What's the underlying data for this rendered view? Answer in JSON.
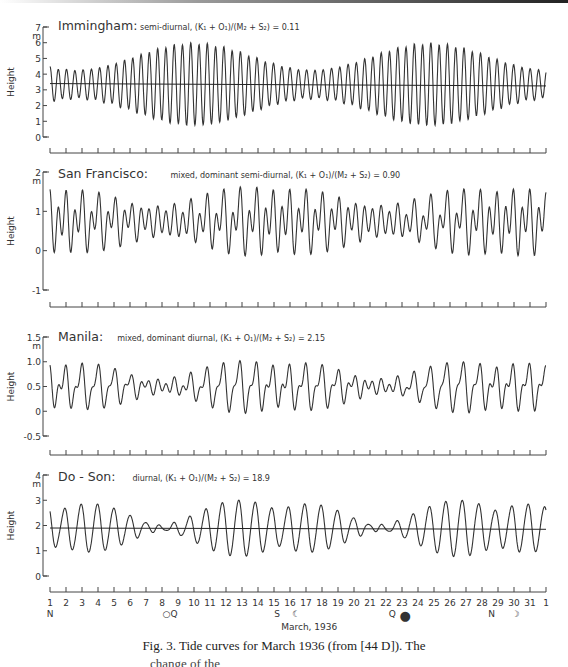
{
  "figure": {
    "caption": "Fig. 3. Tide curves for March 1936 (from [44 D]). The",
    "caption_cutoff": "change of the"
  },
  "chart_data": [
    {
      "type": "line",
      "station": "Immingham",
      "title": "Immingham:",
      "subtitle": "semi-diurnal, (K₁ + O₁)/(M₂ + S₂) = 0.11",
      "ylabel": "Height",
      "yunit": "m",
      "ylim": [
        0,
        7
      ],
      "yticks": [
        0,
        1,
        2,
        3,
        4,
        5,
        6,
        7
      ],
      "mean_line": true,
      "mean_level": [
        3.4,
        3.25
      ],
      "tide_type": "semi-diurnal",
      "ratio": 0.11,
      "model": {
        "mean": 3.35,
        "m2": 1.75,
        "s2": 0.85,
        "k1": 0.12,
        "o1": 0.1,
        "spring_days": [
          10,
          25
        ]
      },
      "observed_range": {
        "max_high": 6.3,
        "min_low": 0.3
      }
    },
    {
      "type": "line",
      "station": "San Francisco",
      "title": "San Francisco:",
      "subtitle": "mixed, dominant semi-diurnal, (K₁ + O₁)/(M₂ + S₂) = 0.90",
      "ylabel": "Height",
      "yunit": "m",
      "ylim": [
        -1,
        2
      ],
      "yticks": [
        -1,
        0,
        1,
        2
      ],
      "mean_line": false,
      "tide_type": "mixed, dominant semi-diurnal",
      "ratio": 0.9,
      "model": {
        "mean": 0.75,
        "m2": 0.45,
        "s2": 0.12,
        "k1": 0.32,
        "o1": 0.2,
        "spring_days": [
          10,
          25
        ]
      },
      "observed_range": {
        "max_high": 1.6,
        "min_low": -0.1
      }
    },
    {
      "type": "line",
      "station": "Manila",
      "title": "Manila:",
      "subtitle": "mixed, dominant diurnal, (K₁ + O₁)/(M₂ + S₂) = 2.15",
      "ylabel": "Height",
      "yunit": "m",
      "ylim": [
        -0.5,
        1.5
      ],
      "yticks": [
        -0.5,
        0,
        0.5,
        1.0,
        1.5
      ],
      "ytick_labels": [
        "-0.5",
        "0",
        "0.5",
        "1.0",
        "1.5"
      ],
      "mean_line": false,
      "tide_type": "mixed, dominant diurnal",
      "ratio": 2.15,
      "model": {
        "mean": 0.5,
        "m2": 0.16,
        "s2": 0.05,
        "k1": 0.28,
        "o1": 0.2,
        "spring_days": [
          10,
          25
        ]
      },
      "observed_range": {
        "max_high": 1.1,
        "min_low": -0.05
      }
    },
    {
      "type": "line",
      "station": "Do-Son",
      "title": "Do - Son:",
      "subtitle": "diurnal, (K₁ + O₁)/(M₂ + S₂) = 18.9",
      "ylabel": "Height",
      "yunit": "m",
      "ylim": [
        0,
        4
      ],
      "yticks": [
        0,
        1,
        2,
        3,
        4
      ],
      "mean_line": true,
      "mean_level": [
        1.9,
        1.85
      ],
      "tide_type": "diurnal",
      "ratio": 18.9,
      "model": {
        "mean": 1.9,
        "m2": 0.05,
        "s2": 0.02,
        "k1": 0.72,
        "o1": 0.55,
        "spring_days": [
          10,
          25
        ]
      },
      "observed_range": {
        "max_high": 3.2,
        "min_low": 0.5
      }
    }
  ],
  "x_axis": {
    "label": "March, 1936",
    "ticks": [
      "1",
      "2",
      "3",
      "4",
      "5",
      "6",
      "7",
      "8",
      "9",
      "10",
      "11",
      "12",
      "13",
      "14",
      "15",
      "16",
      "17",
      "18",
      "19",
      "20",
      "21",
      "22",
      "23",
      "24",
      "25",
      "26",
      "27",
      "28",
      "29",
      "30",
      "31",
      "1"
    ],
    "annotations": [
      {
        "day": 1,
        "text": "N",
        "meaning": "moon node/perigee marker"
      },
      {
        "day": 8.5,
        "text": "○Q",
        "meaning": "full moon, quadrature"
      },
      {
        "day": 15.2,
        "text": "S",
        "meaning": ""
      },
      {
        "day": 16.4,
        "text": "☾",
        "meaning": "last quarter"
      },
      {
        "day": 22.4,
        "text": "Q",
        "meaning": ""
      },
      {
        "day": 23.2,
        "text": "●",
        "meaning": "new moon"
      },
      {
        "day": 28.6,
        "text": "N",
        "meaning": ""
      },
      {
        "day": 30.1,
        "text": "☽",
        "meaning": "first quarter"
      }
    ]
  }
}
